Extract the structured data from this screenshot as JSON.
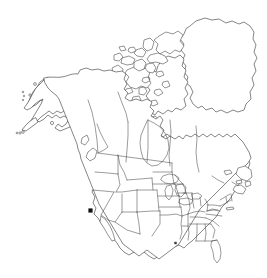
{
  "figure": {
    "type": "distribution-map",
    "title": "",
    "caption": "",
    "region": "North America",
    "background_color": "#ffffff",
    "outline_color": "#3b3b3b",
    "subdivision_color": "#4a4a4a",
    "marker_color": "#111111",
    "width_px": 267,
    "height_px": 278
  },
  "map_data": {
    "projection_note": "North America including Alaska, Canada, Greenland, contiguous United States and northern Mexico",
    "landmasses": [
      {
        "name": "north-american-mainland",
        "label": "North American mainland"
      },
      {
        "name": "greenland",
        "label": "Greenland"
      },
      {
        "name": "canadian-arctic-archipelago",
        "label": "Canadian Arctic Archipelago"
      },
      {
        "name": "aleutian-islands",
        "label": "Aleutian Islands"
      },
      {
        "name": "newfoundland",
        "label": "Newfoundland"
      },
      {
        "name": "vancouver-island",
        "label": "Vancouver Island"
      },
      {
        "name": "baja-california",
        "label": "Baja California"
      },
      {
        "name": "florida-peninsula",
        "label": "Florida Peninsula"
      }
    ],
    "subdivisions_shown": "US states and Canadian provinces/territories",
    "occurrence_points": [
      {
        "id": "point-1",
        "label": "California record",
        "region": "California, United States",
        "x_px": 90.5,
        "y_px": 210.5,
        "size_px": 4.2,
        "shape": "square",
        "color": "#111111",
        "prominence": "primary"
      },
      {
        "id": "point-2",
        "label": "Gulf Coast record",
        "region": "Mississippi / Alabama, United States",
        "x_px": 175.5,
        "y_px": 243.0,
        "size_px": 2.4,
        "shape": "square",
        "color": "#3a3a3a",
        "prominence": "secondary"
      }
    ],
    "legend": {
      "present": false,
      "entries": []
    },
    "scale_bar": {
      "present": false
    },
    "graticule": {
      "present": false
    },
    "axis_labels": {
      "present": false
    }
  }
}
